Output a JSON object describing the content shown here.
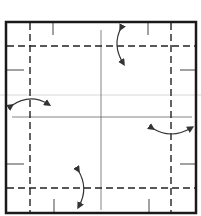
{
  "diagram": {
    "type": "fold-diagram",
    "colors": {
      "border": "#1a1a1a",
      "fold_line": "#222222",
      "crease": "#555555",
      "guide": "#d8d8d8",
      "arrow": "#333333"
    },
    "fold_lines": [
      {
        "name": "top-valley-fold",
        "orientation": "horizontal",
        "style": "dashed"
      },
      {
        "name": "bottom-valley-fold",
        "orientation": "horizontal",
        "style": "dashed"
      },
      {
        "name": "left-valley-fold",
        "orientation": "vertical",
        "style": "dashed"
      },
      {
        "name": "right-valley-fold",
        "orientation": "vertical",
        "style": "dashed"
      }
    ],
    "arrows": [
      {
        "name": "top-fold-arrow",
        "direction": "vertical-double"
      },
      {
        "name": "left-fold-arrow",
        "direction": "horizontal-double"
      },
      {
        "name": "right-fold-arrow",
        "direction": "horizontal-double"
      },
      {
        "name": "bottom-fold-arrow",
        "direction": "vertical-double"
      }
    ]
  }
}
